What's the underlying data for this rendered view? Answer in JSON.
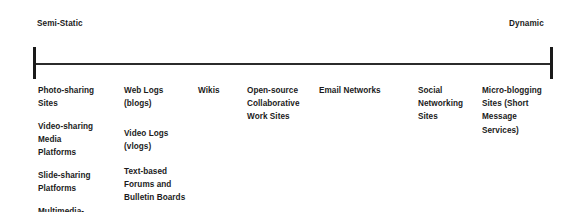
{
  "diagram": {
    "type": "continuum-axis",
    "axis": {
      "left_pole_label": "Semi-Static",
      "right_pole_label": "Dynamic",
      "line_color": "#2b2b2b",
      "cap_color": "#1a1a1a"
    },
    "columns": [
      {
        "name": "photo-sharing-column",
        "blocks": [
          {
            "lines": [
              "Photo-sharing",
              "Sites"
            ]
          },
          {
            "lines": [
              "Video-sharing",
              "Media",
              "Platforms"
            ]
          },
          {
            "lines": [
              "Slide-sharing",
              "Platforms"
            ]
          },
          {
            "lines": [
              "Multimedia-",
              "sharing"
            ]
          }
        ]
      },
      {
        "name": "web-logs-column",
        "blocks": [
          {
            "lines": [
              "Web Logs",
              "(blogs)"
            ]
          },
          {
            "lines": [
              "Video Logs",
              "(vlogs)"
            ]
          },
          {
            "lines": [
              "Text-based",
              "Forums and",
              "Bulletin Boards"
            ]
          }
        ]
      },
      {
        "name": "wikis-column",
        "blocks": [
          {
            "lines": [
              "Wikis"
            ]
          }
        ]
      },
      {
        "name": "open-source-collaborative-column",
        "blocks": [
          {
            "lines": [
              "Open-source",
              "Collaborative",
              "Work Sites"
            ]
          }
        ]
      },
      {
        "name": "email-networks-column",
        "blocks": [
          {
            "lines": [
              "Email Networks"
            ]
          }
        ]
      },
      {
        "name": "social-networking-column",
        "blocks": [
          {
            "lines": [
              "Social",
              "Networking",
              "Sites"
            ]
          }
        ]
      },
      {
        "name": "micro-blogging-column",
        "blocks": [
          {
            "lines": [
              "Micro-blogging",
              "Sites (Short",
              "Message",
              "Services)"
            ]
          }
        ]
      }
    ],
    "block_offsets": {
      "col0": [
        0,
        36,
        85,
        121
      ],
      "col1": [
        0,
        43,
        81
      ],
      "col2": [
        0
      ],
      "col3": [
        0
      ],
      "col4": [
        0
      ],
      "col5": [
        0
      ],
      "col6": [
        0
      ]
    }
  }
}
